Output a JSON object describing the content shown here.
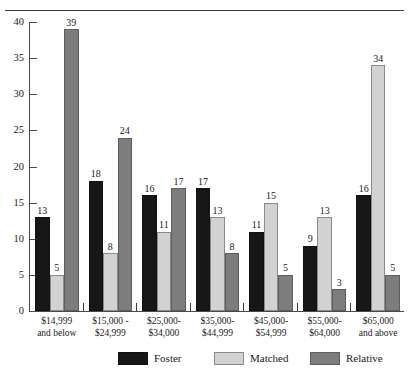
{
  "chart_data": {
    "type": "bar",
    "title": "",
    "xlabel": "",
    "ylabel": "",
    "ylim": [
      0,
      40
    ],
    "ytick_step": 5,
    "yticks": [
      40,
      35,
      30,
      25,
      20,
      15,
      10,
      5,
      0
    ],
    "grid": false,
    "legend_position": "bottom",
    "categories": [
      "$14,999\nand below",
      "$15,000 -\n$24,999",
      "$25,000-\n$34,000",
      "$35,000-\n$44,999",
      "$45,000-\n$54,999",
      "$55,000-\n$64,000",
      "$65,000\nand above"
    ],
    "category_lines": [
      [
        "$14,999",
        "and below"
      ],
      [
        "$15,000 -",
        "$24,999"
      ],
      [
        "$25,000-",
        "$34,000"
      ],
      [
        "$35,000-",
        "$44,999"
      ],
      [
        "$45,000-",
        "$54,999"
      ],
      [
        "$55,000-",
        "$64,000"
      ],
      [
        "$65,000",
        "and above"
      ]
    ],
    "series": [
      {
        "name": "Foster",
        "color": "#171717",
        "values": [
          13,
          18,
          16,
          17,
          11,
          9,
          16
        ]
      },
      {
        "name": "Matched",
        "color": "#d2d2d2",
        "values": [
          5,
          8,
          11,
          13,
          15,
          13,
          34
        ]
      },
      {
        "name": "Relative",
        "color": "#7d7d7d",
        "values": [
          39,
          24,
          17,
          8,
          5,
          3,
          5
        ]
      }
    ]
  },
  "axis": {
    "y_tick_labels": [
      "40",
      "35",
      "30",
      "25",
      "20",
      "15",
      "10",
      "5",
      "0"
    ]
  },
  "legend": {
    "items": [
      {
        "label": "Foster",
        "key": "foster"
      },
      {
        "label": "Matched",
        "key": "matched"
      },
      {
        "label": "Relative",
        "key": "relative"
      }
    ]
  }
}
